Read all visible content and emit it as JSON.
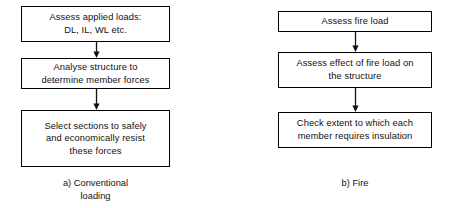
{
  "figure": {
    "type": "flowchart",
    "orientation": "two-column-vertical",
    "ink_color": "#111111",
    "background_color": "#ffffff"
  },
  "columns": [
    {
      "id": "conventional-loading",
      "caption": "a)  Conventional\nloading",
      "steps": [
        {
          "id": "assess-applied-loads",
          "text": "Assess applied loads:\nDL, IL, WL etc."
        },
        {
          "id": "analyse-structure",
          "text": "Analyse structure to\ndetermine member forces"
        },
        {
          "id": "select-sections",
          "text": "Select sections to safely\nand economically resist\nthese forces"
        }
      ],
      "connectors": [
        {
          "id": "connector-1",
          "icon": "down-arrow-icon",
          "glyph": "↓"
        },
        {
          "id": "connector-2",
          "icon": "down-arrow-icon",
          "glyph": "↓"
        }
      ]
    },
    {
      "id": "fire",
      "caption": "b)  Fire",
      "steps": [
        {
          "id": "assess-fire-load",
          "text": "Assess fire load"
        },
        {
          "id": "assess-effect-of-fire-load",
          "text": "Assess effect of fire load on\nthe structure"
        },
        {
          "id": "check-insulation-extent",
          "text": "Check extent to which each\nmember requires insulation"
        }
      ],
      "connectors": [
        {
          "id": "connector-1",
          "icon": "down-arrow-icon",
          "glyph": "↓"
        },
        {
          "id": "connector-2",
          "icon": "down-arrow-icon",
          "glyph": "↓"
        }
      ]
    }
  ]
}
